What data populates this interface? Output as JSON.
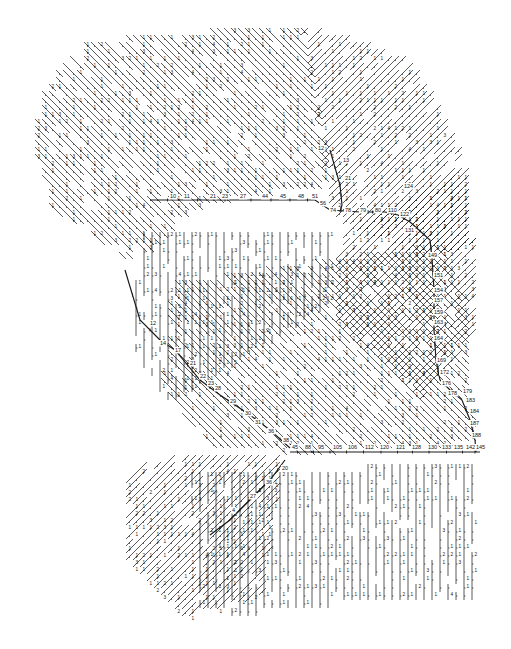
{
  "diagram": {
    "style": {
      "stroke": "#1a1a1a",
      "background": "#ffffff",
      "label_size": 5.5,
      "line_width": 0.9
    },
    "outline": [
      [
        118,
        18
      ],
      [
        200,
        18
      ],
      [
        260,
        22
      ],
      [
        330,
        30
      ],
      [
        400,
        60
      ],
      [
        440,
        110
      ],
      [
        465,
        180
      ],
      [
        470,
        260
      ],
      [
        475,
        330
      ],
      [
        478,
        380
      ],
      [
        485,
        420
      ],
      [
        488,
        450
      ],
      [
        480,
        470
      ],
      [
        478,
        600
      ],
      [
        430,
        600
      ],
      [
        300,
        610
      ],
      [
        200,
        630
      ],
      [
        140,
        620
      ],
      [
        118,
        560
      ],
      [
        120,
        480
      ],
      [
        170,
        450
      ],
      [
        160,
        400
      ],
      [
        130,
        360
      ],
      [
        120,
        320
      ],
      [
        60,
        240
      ],
      [
        30,
        140
      ],
      [
        40,
        90
      ],
      [
        70,
        50
      ],
      [
        95,
        35
      ]
    ],
    "hatch_regions": [
      {
        "name": "nw-diagonals",
        "poly": [
          [
            60,
            40
          ],
          [
            300,
            20
          ],
          [
            330,
            180
          ],
          [
            200,
            200
          ],
          [
            130,
            260
          ],
          [
            40,
            200
          ],
          [
            30,
            110
          ]
        ],
        "dir": "se",
        "spacing": 7,
        "label": "1"
      },
      {
        "name": "ne-diagonals",
        "poly": [
          [
            300,
            30
          ],
          [
            410,
            60
          ],
          [
            460,
            160
          ],
          [
            470,
            250
          ],
          [
            420,
            260
          ],
          [
            330,
            220
          ]
        ],
        "dir": "ne",
        "spacing": 7,
        "label": "1"
      },
      {
        "name": "center-verticals",
        "poly": [
          [
            140,
            230
          ],
          [
            330,
            230
          ],
          [
            330,
            300
          ],
          [
            170,
            400
          ],
          [
            130,
            340
          ]
        ],
        "dir": "v",
        "spacing": 8,
        "label": "1"
      },
      {
        "name": "center-diagonals",
        "poly": [
          [
            170,
            280
          ],
          [
            440,
            240
          ],
          [
            465,
            300
          ],
          [
            470,
            440
          ],
          [
            300,
            450
          ],
          [
            200,
            440
          ],
          [
            160,
            380
          ]
        ],
        "dir": "se",
        "spacing": 7,
        "label": "1"
      },
      {
        "name": "right-ne",
        "poly": [
          [
            330,
            240
          ],
          [
            470,
            170
          ],
          [
            478,
            330
          ],
          [
            420,
            400
          ],
          [
            330,
            320
          ]
        ],
        "dir": "ne",
        "spacing": 7,
        "label": "1"
      },
      {
        "name": "sw-diagonals",
        "poly": [
          [
            120,
            465
          ],
          [
            280,
            455
          ],
          [
            260,
            600
          ],
          [
            180,
            620
          ],
          [
            125,
            560
          ]
        ],
        "dir": "ne",
        "spacing": 7,
        "label": "1"
      },
      {
        "name": "s-verticals",
        "poly": [
          [
            190,
            470
          ],
          [
            480,
            460
          ],
          [
            480,
            600
          ],
          [
            420,
            600
          ],
          [
            330,
            600
          ],
          [
            240,
            610
          ],
          [
            200,
            600
          ]
        ],
        "dir": "v",
        "spacing": 8,
        "label": "1"
      }
    ],
    "trunks": [
      {
        "name": "upper-trunk",
        "points": [
          [
            150,
            200
          ],
          [
            185,
            200
          ],
          [
            210,
            200
          ],
          [
            240,
            200
          ],
          [
            262,
            200
          ],
          [
            280,
            200
          ],
          [
            300,
            200
          ],
          [
            315,
            200
          ],
          [
            330,
            210
          ],
          [
            360,
            212
          ],
          [
            385,
            212
          ],
          [
            398,
            215
          ],
          [
            410,
            222
          ]
        ],
        "labels": [
          [
            "10",
            170,
            198
          ],
          [
            "11",
            184,
            198
          ],
          [
            "21",
            210,
            198
          ],
          [
            "23",
            222,
            198
          ],
          [
            "27",
            240,
            198
          ],
          [
            "44",
            262,
            198
          ],
          [
            "45",
            280,
            198
          ],
          [
            "48",
            298,
            198
          ],
          [
            "51",
            312,
            198
          ],
          [
            "56",
            320,
            205
          ],
          [
            "74",
            330,
            212
          ],
          [
            "78",
            345,
            212
          ],
          [
            "79",
            360,
            212
          ],
          [
            "80",
            375,
            212
          ],
          [
            "110",
            388,
            212
          ],
          [
            "122",
            400,
            216
          ],
          [
            "124",
            404,
            188
          ],
          [
            "131",
            405,
            232
          ]
        ]
      },
      {
        "name": "right-vertical-trunk",
        "points": [
          [
            410,
            222
          ],
          [
            430,
            240
          ],
          [
            432,
            258
          ],
          [
            434,
            290
          ],
          [
            434,
            330
          ],
          [
            436,
            360
          ],
          [
            440,
            380
          ],
          [
            450,
            390
          ],
          [
            462,
            400
          ],
          [
            470,
            420
          ],
          [
            475,
            440
          ],
          [
            476,
            452
          ]
        ],
        "labels": [
          [
            "149",
            428,
            257
          ],
          [
            "151",
            434,
            277
          ],
          [
            "154",
            434,
            292
          ],
          [
            "157",
            434,
            302
          ],
          [
            "159",
            434,
            314
          ],
          [
            "163",
            434,
            324
          ],
          [
            "164",
            434,
            340
          ],
          [
            "169",
            437,
            362
          ],
          [
            "172",
            440,
            374
          ],
          [
            "176",
            442,
            385
          ],
          [
            "178",
            448,
            395
          ],
          [
            "179",
            463,
            393
          ],
          [
            "183",
            466,
            402
          ],
          [
            "184",
            470,
            413
          ],
          [
            "187",
            470,
            425
          ],
          [
            "188",
            472,
            437
          ]
        ]
      },
      {
        "name": "left-diagonal-trunk",
        "points": [
          [
            125,
            270
          ],
          [
            140,
            320
          ],
          [
            160,
            340
          ],
          [
            175,
            350
          ],
          [
            200,
            380
          ],
          [
            220,
            395
          ],
          [
            250,
            415
          ],
          [
            270,
            430
          ],
          [
            290,
            448
          ]
        ],
        "labels": [
          [
            "12",
            150,
            325
          ],
          [
            "14",
            160,
            345
          ],
          [
            "17",
            175,
            352
          ],
          [
            "21",
            190,
            365
          ],
          [
            "22",
            200,
            378
          ],
          [
            "23",
            208,
            385
          ],
          [
            "28",
            215,
            390
          ],
          [
            "29",
            230,
            403
          ],
          [
            "30",
            245,
            415
          ],
          [
            "31",
            255,
            424
          ],
          [
            "36",
            268,
            433
          ],
          [
            "38",
            283,
            442
          ]
        ]
      },
      {
        "name": "lower-main-trunk",
        "points": [
          [
            290,
            452
          ],
          [
            305,
            452
          ],
          [
            322,
            452
          ],
          [
            338,
            452
          ],
          [
            355,
            452
          ],
          [
            372,
            452
          ],
          [
            390,
            452
          ],
          [
            405,
            452
          ],
          [
            420,
            452
          ],
          [
            438,
            452
          ],
          [
            455,
            452
          ],
          [
            470,
            452
          ],
          [
            480,
            452
          ]
        ],
        "labels": [
          [
            "45",
            292,
            449
          ],
          [
            "88",
            305,
            449
          ],
          [
            "95",
            318,
            449
          ],
          [
            "105",
            333,
            449
          ],
          [
            "106",
            348,
            449
          ],
          [
            "112",
            365,
            449
          ],
          [
            "120",
            380,
            449
          ],
          [
            "121",
            396,
            449
          ],
          [
            "128",
            412,
            449
          ],
          [
            "130",
            428,
            449
          ],
          [
            "133",
            442,
            449
          ],
          [
            "135",
            454,
            449
          ],
          [
            "142",
            466,
            449
          ],
          [
            "145",
            476,
            449
          ]
        ]
      },
      {
        "name": "upper-right-branch",
        "points": [
          [
            330,
            150
          ],
          [
            340,
            185
          ],
          [
            342,
            205
          ],
          [
            340,
            212
          ]
        ],
        "labels": [
          [
            "13",
            343,
            162
          ],
          [
            "21",
            345,
            180
          ],
          [
            "12",
            318,
            150
          ]
        ]
      },
      {
        "name": "sw-branch",
        "points": [
          [
            285,
            460
          ],
          [
            270,
            480
          ],
          [
            250,
            500
          ],
          [
            230,
            520
          ],
          [
            210,
            535
          ]
        ],
        "labels": [
          [
            "20",
            282,
            470
          ],
          [
            "36",
            266,
            484
          ],
          [
            "27",
            250,
            498
          ],
          [
            "4",
            232,
            512
          ]
        ]
      }
    ]
  }
}
